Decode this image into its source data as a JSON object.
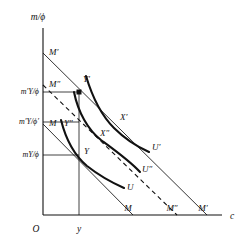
{
  "figure": {
    "type": "economics-diagram",
    "axes": {
      "y_label": "m/ϕ",
      "x_label": "c",
      "origin_label": "O"
    },
    "y_axis_ticks": [
      {
        "id": "tick-mprime-Y-phi",
        "label": "m′Y/ϕ",
        "y": 92
      },
      {
        "id": "tick-mprime-Y-phiprime",
        "label": "m′Y/ϕ′",
        "y": 122
      },
      {
        "id": "tick-m-Y-phi",
        "label": "mY/ϕ",
        "y": 155
      }
    ],
    "x_axis_ticks": [
      {
        "id": "tick-y",
        "label": "y",
        "x": 79
      }
    ],
    "budget_lines": [
      {
        "id": "budget-line-M",
        "label": "M",
        "label_x": 128,
        "label_y": 209
      },
      {
        "id": "budget-line-M-double-prime",
        "label": "M″",
        "label_x": 172,
        "label_y": 209
      },
      {
        "id": "budget-line-M-prime",
        "label": "M′",
        "label_x": 203,
        "label_y": 209
      }
    ],
    "budget_line_intercepts": [
      {
        "id": "intercept-M-prime",
        "label": "M′",
        "label_x": 49,
        "label_y": 53
      },
      {
        "id": "intercept-M-double-prime",
        "label": "M″",
        "label_x": 49,
        "label_y": 85
      },
      {
        "id": "intercept-M",
        "label": "M",
        "label_x": 49,
        "label_y": 124
      }
    ],
    "indifference_curves": [
      {
        "id": "curve-U",
        "label": "U",
        "label_x": 127,
        "label_y": 188
      },
      {
        "id": "curve-U-double-prime",
        "label": "U″",
        "label_x": 140,
        "label_y": 170
      },
      {
        "id": "curve-U-prime",
        "label": "U′",
        "label_x": 147,
        "label_y": 148
      }
    ],
    "points": [
      {
        "id": "point-Y-prime",
        "label": "Y′",
        "x": 79,
        "y": 92,
        "label_x": 82,
        "label_y": 80,
        "marker": true
      },
      {
        "id": "point-Y-double-prime",
        "label": "Y″",
        "x": 79,
        "y": 122,
        "label_x": 66,
        "label_y": 124,
        "marker": false
      },
      {
        "id": "point-Y",
        "label": "Y",
        "x": 79,
        "y": 155,
        "label_x": 84,
        "label_y": 152,
        "marker": false
      },
      {
        "id": "point-X-prime",
        "label": "X′",
        "x": 118,
        "y": 124,
        "label_x": 118,
        "label_y": 120,
        "marker": false
      },
      {
        "id": "point-X-double-prime",
        "label": "X″",
        "x": 103,
        "y": 136,
        "label_x": 101,
        "label_y": 134,
        "marker": false
      }
    ]
  }
}
